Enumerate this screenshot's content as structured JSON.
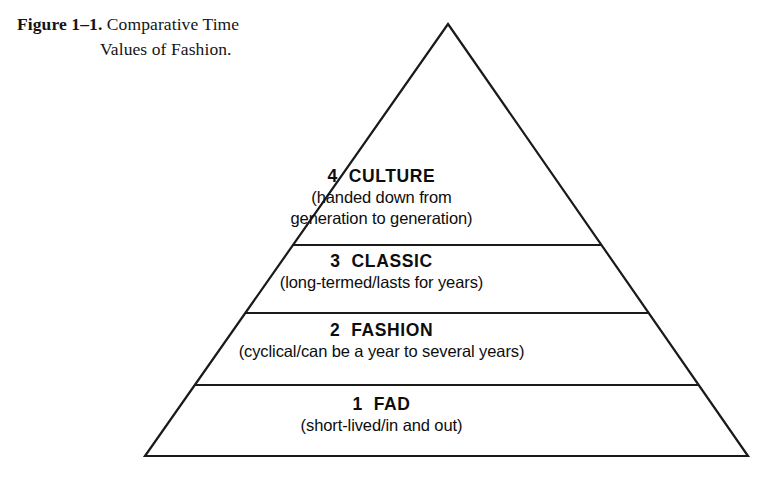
{
  "figure": {
    "caption_label": "Figure 1–1.",
    "caption_line1": " Comparative Time",
    "caption_line2": "Values of Fashion.",
    "alt_title": "Comparative Time Values of Fashion"
  },
  "diagram": {
    "type": "pyramid",
    "stroke_color": "#1a1a1a",
    "fill_color": "#ffffff",
    "apex": {
      "x": 448,
      "y": 24
    },
    "base_left": {
      "x": 145,
      "y": 456
    },
    "base_right": {
      "x": 748,
      "y": 456
    },
    "divider_y": [
      245,
      313,
      385
    ],
    "tiers": [
      {
        "number": "4",
        "name": "CULTURE",
        "title": "4  CULTURE",
        "subtitle_lines": [
          "(handed down from",
          "generation to generation)"
        ]
      },
      {
        "number": "3",
        "name": "CLASSIC",
        "title": "3  CLASSIC",
        "subtitle_lines": [
          "(long-termed/lasts for years)"
        ]
      },
      {
        "number": "2",
        "name": "FASHION",
        "title": "2  FASHION",
        "subtitle_lines": [
          "(cyclical/can be a year to several years)"
        ]
      },
      {
        "number": "1",
        "name": "FAD",
        "title": "1  FAD",
        "subtitle_lines": [
          "(short-lived/in and out)"
        ]
      }
    ]
  }
}
